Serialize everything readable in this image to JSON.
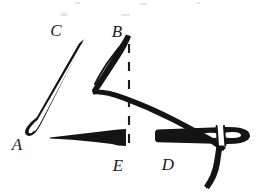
{
  "figure": {
    "kind": "line-drawing",
    "background_color": "#ffffff",
    "ink_color": "#141414",
    "width": 268,
    "height": 196,
    "labels": [
      {
        "id": "label-c",
        "text": "C",
        "x": 56,
        "y": 36,
        "anchor": "middle"
      },
      {
        "id": "label-b",
        "text": "B",
        "x": 117,
        "y": 37,
        "anchor": "middle"
      },
      {
        "id": "label-a",
        "text": "A",
        "x": 17,
        "y": 150,
        "anchor": "middle"
      },
      {
        "id": "label-e",
        "text": "E",
        "x": 118,
        "y": 171,
        "anchor": "middle"
      },
      {
        "id": "label-d",
        "text": "D",
        "x": 168,
        "y": 170,
        "anchor": "middle"
      }
    ],
    "annotation": {
      "dashed_line": {
        "id": "dashed-guide-line",
        "from_label": "B",
        "to_label": "E",
        "x": 129,
        "y_top": 44,
        "y_bottom": 152,
        "dash_pattern": "9 9",
        "stroke_width": 2.1
      }
    },
    "parts": [
      {
        "id": "needle-shaft",
        "from_label": "C",
        "to_label": "A",
        "style": "outline"
      },
      {
        "id": "needle-tip-loop",
        "at_label": "A",
        "style": "outline-round"
      },
      {
        "id": "thread-strand",
        "from_label": "B",
        "to_label": "D",
        "style": "outline"
      },
      {
        "id": "tissue-wedge",
        "near_label": "E",
        "style": "solid-fill"
      },
      {
        "id": "tissue-block",
        "near_label": "D",
        "style": "solid-fill"
      },
      {
        "id": "needle-eye",
        "near_label": "D",
        "style": "knockout"
      },
      {
        "id": "thread-tail",
        "below_label": "D",
        "style": "outline-curve"
      }
    ]
  }
}
